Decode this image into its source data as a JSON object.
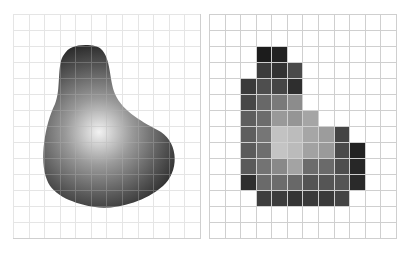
{
  "figure": {
    "panels": [
      {
        "id": "continuous",
        "description": "Continuous grayscale blob image over a grid"
      },
      {
        "id": "pixelated",
        "description": "Same blob sampled into grid pixels"
      }
    ],
    "grid": {
      "columns": 12,
      "rows": 14,
      "line_color": "#cfcfcf"
    },
    "blob": {
      "highlight_color": "#f2f2f2",
      "mid_color": "#8a8a8a",
      "edge_color": "#1e1e1e"
    },
    "mosaic": [
      {
        "r": 2,
        "cells": {
          "3": "#1c1c1c",
          "4": "#222222"
        }
      },
      {
        "r": 3,
        "cells": {
          "3": "#3c3c3c",
          "4": "#333333",
          "5": "#4a4a4a"
        }
      },
      {
        "r": 4,
        "cells": {
          "2": "#3a3a3a",
          "3": "#4e4e4e",
          "4": "#454545",
          "5": "#2e2e2e"
        }
      },
      {
        "r": 5,
        "cells": {
          "2": "#474747",
          "3": "#686868",
          "4": "#7a7a7a",
          "5": "#8c8c8c"
        }
      },
      {
        "r": 6,
        "cells": {
          "2": "#5e5e5e",
          "3": "#6c6c6c",
          "4": "#999999",
          "5": "#959595",
          "6": "#a5a5a5"
        }
      },
      {
        "r": 7,
        "cells": {
          "2": "#5e5e5e",
          "3": "#767676",
          "4": "#c2c2c2",
          "5": "#bcbcbc",
          "6": "#a6a6a6",
          "7": "#9c9c9c",
          "8": "#444444"
        }
      },
      {
        "r": 8,
        "cells": {
          "2": "#5b5b5b",
          "3": "#6e6e6e",
          "4": "#c4c4c4",
          "5": "#bbbbbb",
          "6": "#a2a2a2",
          "7": "#9a9a9a",
          "8": "#4a4a4a",
          "9": "#222222"
        }
      },
      {
        "r": 9,
        "cells": {
          "2": "#5a5a5a",
          "3": "#737373",
          "4": "#898989",
          "5": "#a3a3a3",
          "6": "#6c6c6c",
          "7": "#6a6a6a",
          "8": "#4e4e4e",
          "9": "#272727"
        }
      },
      {
        "r": 10,
        "cells": {
          "2": "#2f2f2f",
          "3": "#6a6a6a",
          "4": "#6c6c6c",
          "5": "#686868",
          "6": "#545454",
          "7": "#555555",
          "8": "#555555",
          "9": "#2a2a2a"
        }
      },
      {
        "r": 11,
        "cells": {
          "3": "#3e3e3e",
          "4": "#3c3c3c",
          "5": "#353535",
          "6": "#3a3a3a",
          "7": "#3a3a3a",
          "8": "#444444"
        }
      }
    ]
  }
}
